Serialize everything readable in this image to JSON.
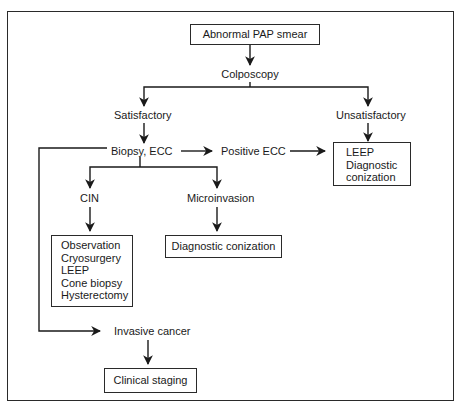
{
  "diagram": {
    "type": "flowchart",
    "nodes": {
      "abnormal_pap": "Abnormal PAP smear",
      "colposcopy": "Colposcopy",
      "satisfactory": "Satisfactory",
      "unsatisfactory": "Unsatisfactory",
      "biopsy_ecc": "Biopsy, ECC",
      "positive_ecc": "Positive ECC",
      "leep_box": [
        "LEEP",
        "Diagnostic",
        "conization"
      ],
      "cin": "CIN",
      "microinvasion": "Microinvasion",
      "cin_treatments": [
        "Observation",
        "Cryosurgery",
        "LEEP",
        "Cone biopsy",
        "Hysterectomy"
      ],
      "diagnostic_conization": "Diagnostic conization",
      "invasive_cancer": "Invasive cancer",
      "clinical_staging": "Clinical staging"
    },
    "edges": [
      [
        "Abnormal PAP smear",
        "Colposcopy"
      ],
      [
        "Colposcopy",
        "Satisfactory"
      ],
      [
        "Colposcopy",
        "Unsatisfactory"
      ],
      [
        "Satisfactory",
        "Biopsy, ECC"
      ],
      [
        "Unsatisfactory",
        "LEEP / Diagnostic conization"
      ],
      [
        "Biopsy, ECC",
        "Positive ECC"
      ],
      [
        "Positive ECC",
        "LEEP / Diagnostic conization"
      ],
      [
        "Biopsy, ECC",
        "CIN"
      ],
      [
        "Biopsy, ECC",
        "Microinvasion"
      ],
      [
        "CIN",
        "Observation / Cryosurgery / LEEP / Cone biopsy / Hysterectomy"
      ],
      [
        "Microinvasion",
        "Diagnostic conization"
      ],
      [
        "Biopsy, ECC",
        "Invasive cancer"
      ],
      [
        "Invasive cancer",
        "Clinical staging"
      ]
    ]
  }
}
